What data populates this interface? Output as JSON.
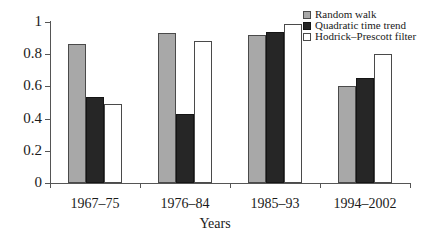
{
  "chart_data": {
    "type": "bar",
    "title": "",
    "subtitle": "",
    "xlabel": "Years",
    "ylabel": "",
    "categories": [
      "1967–75",
      "1976–84",
      "1985–93",
      "1994–2002"
    ],
    "series": [
      {
        "name": "Random walk",
        "color": "#a8a8a8",
        "values": [
          0.865,
          0.93,
          0.92,
          0.6
        ]
      },
      {
        "name": "Quadratic time trend",
        "color": "#262626",
        "values": [
          0.535,
          0.43,
          0.94,
          0.655
        ]
      },
      {
        "name": "Hodrick–Prescott filter",
        "color": "#ffffff",
        "values": [
          0.49,
          0.885,
          0.99,
          0.8
        ]
      }
    ],
    "ylim": [
      0,
      1
    ],
    "yticks": [
      0,
      0.2,
      0.4,
      0.6,
      0.8,
      1
    ],
    "ytick_labels": [
      "0",
      "0.2",
      "0.4",
      "0.6",
      "0.8",
      "1"
    ],
    "grid": false,
    "legend_position": "top-right"
  },
  "axis": {
    "x_title": "Years"
  }
}
